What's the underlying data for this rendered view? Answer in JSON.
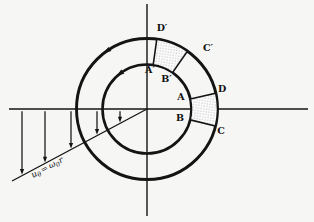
{
  "diagram": {
    "background": "#f6f6f5",
    "ink": "#141414",
    "labels": {
      "d_prime": "D′",
      "c_prime": "C′",
      "a_prime": "A′",
      "b_prime": "B′",
      "d": "D",
      "c": "C",
      "a": "A",
      "b": "B"
    },
    "equation": {
      "u": "u",
      "u_sub": "θ",
      "equals": "=",
      "omega": "ω",
      "omega_sub": "0",
      "r": "r"
    },
    "geometry": {
      "center_x": 147,
      "center_y": 109,
      "radius_inner": 44.5,
      "radius_outer": 70.5
    },
    "velocity_profile": {
      "arrows_x": [
        22,
        45,
        71,
        97,
        120
      ],
      "line_x1": 12,
      "line_y1": 181,
      "line_x2": 147,
      "line_y2": 109
    }
  }
}
